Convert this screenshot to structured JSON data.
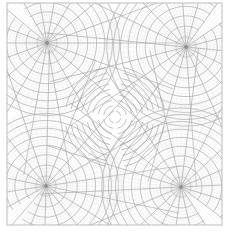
{
  "diagram": {
    "type": "conformal-map-grid",
    "frame": {
      "x": 7,
      "y": 3,
      "width": 215,
      "height": 222,
      "stroke": "#bdbdbd"
    },
    "center": {
      "x": 115,
      "y": 117
    },
    "colors": {
      "fine_grid": "#e2e2e2",
      "coarse_grid": "#a9a9a9",
      "dense_grid": "#9a9a9a",
      "background": "#ffffff"
    },
    "lobes": [
      {
        "name": "top-left",
        "cx": 47,
        "cy": 43,
        "r": 74
      },
      {
        "name": "top-right",
        "cx": 186,
        "cy": 47,
        "r": 80
      },
      {
        "name": "bottom-left",
        "cx": 46,
        "cy": 186,
        "r": 76
      },
      {
        "name": "bottom-right",
        "cx": 181,
        "cy": 187,
        "r": 80
      }
    ],
    "markers": [
      {
        "x": 47,
        "y": 43
      },
      {
        "x": 186,
        "y": 47
      },
      {
        "x": 46,
        "y": 186
      },
      {
        "x": 181,
        "y": 187
      }
    ]
  }
}
